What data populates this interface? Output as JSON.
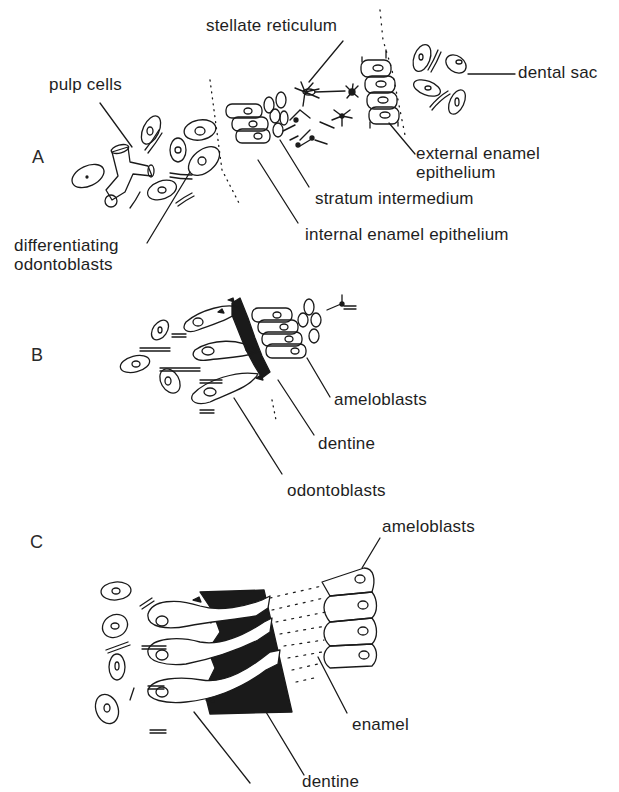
{
  "figure": {
    "panels": [
      {
        "id": "A",
        "letter": "A",
        "labels": {
          "stellate_reticulum": "stellate reticulum",
          "pulp_cells": "pulp cells",
          "dental_sac": "dental sac",
          "external_enamel_epithelium_line1": "external enamel",
          "external_enamel_epithelium_line2": "epithelium",
          "stratum_intermedium": "stratum intermedium",
          "internal_enamel_epithelium": "internal enamel epithelium",
          "differentiating_odontoblasts_line1": "differentiating",
          "differentiating_odontoblasts_line2": "odontoblasts"
        }
      },
      {
        "id": "B",
        "letter": "B",
        "labels": {
          "ameloblasts": "ameloblasts",
          "dentine": "dentine",
          "odontoblasts": "odontoblasts"
        }
      },
      {
        "id": "C",
        "letter": "C",
        "labels": {
          "ameloblasts": "ameloblasts",
          "enamel": "enamel",
          "dentine": "dentine",
          "odontoblast": "odontoblast"
        }
      }
    ],
    "colors": {
      "background": "#ffffff",
      "ink": "#1a1a1a"
    }
  }
}
